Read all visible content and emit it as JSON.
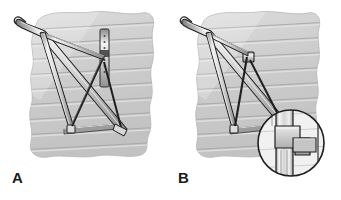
{
  "figure": {
    "panels": [
      {
        "id": "A",
        "label": "A",
        "caption": "A",
        "description": "Scaffold bracket frame attached to clapboard siding wall with long perforated vertical mounting plate",
        "components": [
          "curved hook top rail",
          "diagonal brace",
          "cross brace",
          "vertical leg post",
          "horizontal bottom rail",
          "perforated wall mounting plate"
        ]
      },
      {
        "id": "B",
        "label": "B",
        "caption": "B",
        "description": "Scaffold bracket frame attached to clapboard siding wall with short bracket connector and magnified joint detail",
        "components": [
          "curved hook top rail",
          "diagonal brace",
          "cross brace",
          "vertical leg post",
          "horizontal bottom rail",
          "short bracket connector"
        ],
        "detail_inset": {
          "name": "joint-detail-circle",
          "description": "Magnified view of tee joint where horizontal member meets vertical post"
        }
      }
    ],
    "colors": {
      "background": "#ffffff",
      "wall_fill": "#cfcfcf",
      "wall_light": "#e3e3e3",
      "wall_line": "#a8a8a8",
      "frame_light": "#f2f2f2",
      "frame_mid": "#b9b9b9",
      "frame_dark": "#6f6f6f",
      "outline": "#1f1f1f",
      "label_color": "#1a1a1a"
    }
  }
}
